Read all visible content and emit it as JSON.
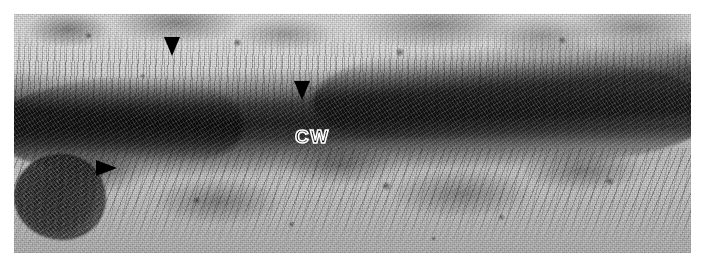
{
  "figure": {
    "kind": "transmission-electron-micrograph",
    "background_color": "#ffffff",
    "plate": {
      "left": 14,
      "top": 14,
      "width": 677,
      "height": 239,
      "tone_low": "#111111",
      "tone_mid": "#8a8a8a",
      "tone_high": "#f2f2f2"
    }
  },
  "labels": [
    {
      "id": "cell-wall",
      "text": "CW",
      "style": "white-outline",
      "color": "#ffffff",
      "x": 295,
      "y": 127
    }
  ],
  "arrowheads": [
    {
      "id": "arrowhead-1",
      "direction": "down",
      "color": "#000000",
      "x": 164,
      "y": 37
    },
    {
      "id": "arrowhead-2",
      "direction": "down",
      "color": "#000000",
      "x": 294,
      "y": 81
    },
    {
      "id": "arrowhead-3",
      "direction": "right",
      "color": "#000000",
      "x": 96,
      "y": 160
    }
  ],
  "features": {
    "cell_wall_band": {
      "description": "thick dark electron-dense band running left-to-right, curving upward toward the right",
      "color": "#050505"
    },
    "upper_cytoplasm": {
      "description": "light granular field with vertical microfibril striations",
      "color": "#e1e1e1"
    },
    "lower_cytoplasm": {
      "description": "granular field with diagonal striations",
      "color": "#cbcbcb"
    },
    "organelle": {
      "description": "dark rounded electron-dense body at lower left",
      "color": "#0a0a0a",
      "x": 0,
      "y": 140,
      "width": 92,
      "height": 86
    }
  }
}
